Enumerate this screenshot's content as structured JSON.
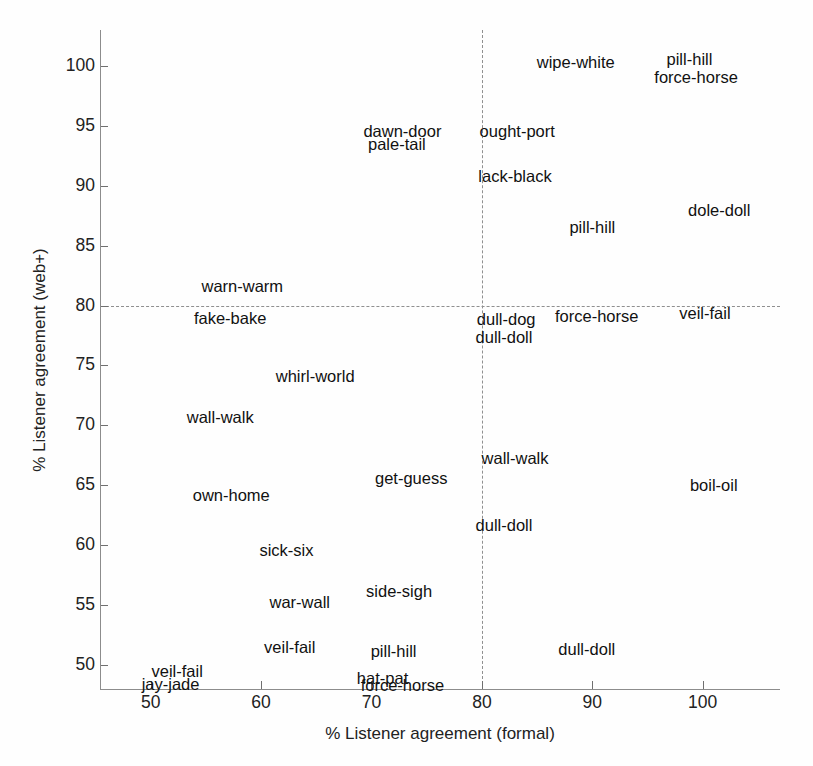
{
  "chart_data": {
    "type": "scatter",
    "title": "",
    "xlabel": "% Listener agreement (formal)",
    "ylabel": "% Listener agreement (web+)",
    "xlim": [
      45.5,
      107
    ],
    "ylim": [
      48,
      103
    ],
    "xticks": [
      50,
      60,
      70,
      80,
      90,
      100
    ],
    "yticks": [
      50,
      55,
      60,
      65,
      70,
      75,
      80,
      85,
      90,
      95,
      100
    ],
    "grid": false,
    "legend": null,
    "reference_lines": [
      {
        "orientation": "horizontal",
        "value": 80,
        "style": "dashed"
      },
      {
        "orientation": "vertical",
        "value": 80,
        "style": "dashed"
      }
    ],
    "marker": "text-label-only",
    "points": [
      {
        "label": "wipe-white",
        "x": 88.5,
        "y": 100.3
      },
      {
        "label": "pill-hill",
        "x": 98.8,
        "y": 100.6
      },
      {
        "label": "force-horse",
        "x": 99.4,
        "y": 99.1
      },
      {
        "label": "dawn-door",
        "x": 72.8,
        "y": 94.6
      },
      {
        "label": "pale-tail",
        "x": 72.3,
        "y": 93.5
      },
      {
        "label": "ought-port",
        "x": 83.2,
        "y": 94.6
      },
      {
        "label": "lack-black",
        "x": 83.0,
        "y": 90.8
      },
      {
        "label": "pill-hill",
        "x": 90.0,
        "y": 86.6
      },
      {
        "label": "dole-doll",
        "x": 101.5,
        "y": 88.0
      },
      {
        "label": "warn-warm",
        "x": 58.3,
        "y": 81.6
      },
      {
        "label": "fake-bake",
        "x": 57.2,
        "y": 79.0
      },
      {
        "label": "dull-dog",
        "x": 82.2,
        "y": 78.9
      },
      {
        "label": "dull-doll",
        "x": 82.0,
        "y": 77.4
      },
      {
        "label": "force-horse",
        "x": 90.4,
        "y": 79.1
      },
      {
        "label": "veil-fail",
        "x": 100.2,
        "y": 79.4
      },
      {
        "label": "whirl-world",
        "x": 64.9,
        "y": 74.1
      },
      {
        "label": "wall-walk",
        "x": 56.3,
        "y": 70.7
      },
      {
        "label": "wall-walk",
        "x": 83.0,
        "y": 67.3
      },
      {
        "label": "get-guess",
        "x": 73.6,
        "y": 65.6
      },
      {
        "label": "boil-oil",
        "x": 101.0,
        "y": 65.0
      },
      {
        "label": "own-home",
        "x": 57.3,
        "y": 64.2
      },
      {
        "label": "dull-doll",
        "x": 82.0,
        "y": 61.7
      },
      {
        "label": "sick-six",
        "x": 62.3,
        "y": 59.6
      },
      {
        "label": "side-sigh",
        "x": 72.5,
        "y": 56.2
      },
      {
        "label": "war-wall",
        "x": 63.5,
        "y": 55.3
      },
      {
        "label": "veil-fail",
        "x": 62.6,
        "y": 51.5
      },
      {
        "label": "pill-hill",
        "x": 72.0,
        "y": 51.2
      },
      {
        "label": "dull-doll",
        "x": 89.5,
        "y": 51.3
      },
      {
        "label": "veil-fail",
        "x": 52.4,
        "y": 49.5
      },
      {
        "label": "jay-jade",
        "x": 51.8,
        "y": 48.4
      },
      {
        "label": "hat-pat",
        "x": 71.0,
        "y": 48.9
      },
      {
        "label": "force-horse",
        "x": 72.8,
        "y": 48.3
      }
    ]
  },
  "axes": {
    "xlabel": "% Listener agreement (formal)",
    "ylabel": "% Listener agreement (web+)"
  },
  "colors": {
    "axis": "#8c8c8c",
    "tick": "#6f6f6f",
    "text": "#111111",
    "reference_line": "#8f8f8f",
    "background": "#ffffff"
  }
}
